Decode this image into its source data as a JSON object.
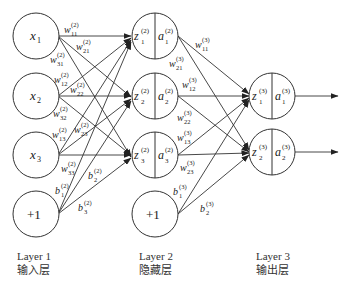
{
  "layers": [
    {
      "name": "Layer 1",
      "subtitle": "输入层"
    },
    {
      "name": "Layer 2",
      "subtitle": "隐藏层"
    },
    {
      "name": "Layer 3",
      "subtitle": "输出层"
    }
  ],
  "input_nodes": [
    {
      "base": "x",
      "sub": "1"
    },
    {
      "base": "x",
      "sub": "2"
    },
    {
      "base": "x",
      "sub": "3"
    },
    {
      "base": "+1",
      "sub": ""
    }
  ],
  "hidden_nodes": [
    {
      "z": "z",
      "zsub": "1",
      "a": "a",
      "asub": "1",
      "sup": "(2)"
    },
    {
      "z": "z",
      "zsub": "2",
      "a": "a",
      "asub": "2",
      "sup": "(2)"
    },
    {
      "z": "z",
      "zsub": "3",
      "a": "a",
      "asub": "3",
      "sup": "(2)"
    },
    {
      "bias": "+1"
    }
  ],
  "output_nodes": [
    {
      "z": "z",
      "zsub": "1",
      "a": "a",
      "asub": "1",
      "sup": "(3)"
    },
    {
      "z": "z",
      "zsub": "2",
      "a": "a",
      "asub": "2",
      "sup": "(3)"
    }
  ],
  "weights_layer2": [
    {
      "base": "w",
      "sub": "11",
      "sup": "(2)"
    },
    {
      "base": "w",
      "sub": "21",
      "sup": "(2)"
    },
    {
      "base": "w",
      "sub": "31",
      "sup": "(2)"
    },
    {
      "base": "w",
      "sub": "12",
      "sup": "(2)"
    },
    {
      "base": "w",
      "sub": "22",
      "sup": "(2)"
    },
    {
      "base": "w",
      "sub": "32",
      "sup": "(2)"
    },
    {
      "base": "w",
      "sub": "13",
      "sup": "(2)"
    },
    {
      "base": "w",
      "sub": "23",
      "sup": "(2)"
    },
    {
      "base": "w",
      "sub": "33",
      "sup": "(2)"
    },
    {
      "base": "b",
      "sub": "1",
      "sup": "(2)"
    },
    {
      "base": "b",
      "sub": "2",
      "sup": "(2)"
    },
    {
      "base": "b",
      "sub": "3",
      "sup": "(2)"
    }
  ],
  "weights_layer3": [
    {
      "base": "w",
      "sub": "11",
      "sup": "(3)"
    },
    {
      "base": "w",
      "sub": "21",
      "sup": "(3)"
    },
    {
      "base": "w",
      "sub": "12",
      "sup": "(3)"
    },
    {
      "base": "w",
      "sub": "22",
      "sup": "(3)"
    },
    {
      "base": "w",
      "sub": "13",
      "sup": "(3)"
    },
    {
      "base": "w",
      "sub": "23",
      "sup": "(3)"
    },
    {
      "base": "b",
      "sub": "1",
      "sup": "(3)"
    },
    {
      "base": "b",
      "sub": "2",
      "sup": "(3)"
    }
  ]
}
